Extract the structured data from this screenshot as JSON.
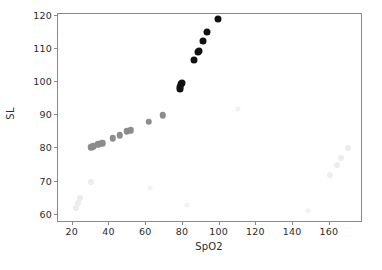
{
  "figure": {
    "background_color": "#ffffff",
    "axes_color": "#8a8a8a",
    "text_color": "#2b2b2b"
  },
  "chart_data": {
    "type": "scatter",
    "title": "",
    "xlabel": "SpO2",
    "ylabel": "SL",
    "xlim": [
      12,
      178
    ],
    "ylim": [
      57.5,
      120.5
    ],
    "xticks": [
      20,
      40,
      60,
      80,
      100,
      120,
      140,
      160
    ],
    "yticks": [
      60,
      70,
      80,
      90,
      100,
      110,
      120
    ],
    "xtick_labels": [
      "20",
      "40",
      "60",
      "80",
      "100",
      "120",
      "140",
      "160"
    ],
    "ytick_labels": [
      "60",
      "70",
      "80",
      "90",
      "100",
      "110",
      "120"
    ],
    "grid": false,
    "legend": null,
    "marker": "circle",
    "note": "Point shade encodes a third variable: near-white for the faintest outlier groups, mid-gray for the main low-SpO2 arm, and black for the steep high-SpO2 arm.",
    "series": [
      {
        "name": "very-faint-lower-left",
        "color": "#ececec",
        "marker_size": 6,
        "points": [
          {
            "x": 22,
            "y": 62.0
          },
          {
            "x": 23,
            "y": 63.5
          },
          {
            "x": 24,
            "y": 65.0
          },
          {
            "x": 30,
            "y": 70.0
          }
        ]
      },
      {
        "name": "very-faint-lower-right",
        "color": "#ededed",
        "marker_size": 6,
        "points": [
          {
            "x": 160,
            "y": 72.0
          },
          {
            "x": 164,
            "y": 75.0
          },
          {
            "x": 166,
            "y": 77.0
          },
          {
            "x": 170,
            "y": 80.0
          }
        ]
      },
      {
        "name": "faint-scatter",
        "color": "#f2f2f2",
        "marker_size": 5,
        "points": [
          {
            "x": 62,
            "y": 68.0
          },
          {
            "x": 82,
            "y": 63.0
          },
          {
            "x": 110,
            "y": 92.0
          },
          {
            "x": 148,
            "y": 61.0
          }
        ]
      },
      {
        "name": "mid-gray-arm",
        "color": "#8c8c8c",
        "marker_size": 6.5,
        "points": [
          {
            "x": 30.0,
            "y": 80.3
          },
          {
            "x": 31.2,
            "y": 80.6
          },
          {
            "x": 33.8,
            "y": 81.2
          },
          {
            "x": 35.2,
            "y": 81.4
          },
          {
            "x": 36.2,
            "y": 81.6
          },
          {
            "x": 41.8,
            "y": 83.0
          },
          {
            "x": 45.6,
            "y": 84.0
          },
          {
            "x": 49.4,
            "y": 85.1
          },
          {
            "x": 50.6,
            "y": 85.3
          },
          {
            "x": 51.6,
            "y": 85.4
          },
          {
            "x": 61.4,
            "y": 88.0
          },
          {
            "x": 69.0,
            "y": 90.0
          }
        ]
      },
      {
        "name": "dark-arm",
        "color": "#111111",
        "marker_size": 7,
        "points": [
          {
            "x": 78.2,
            "y": 98.0
          },
          {
            "x": 78.6,
            "y": 98.4
          },
          {
            "x": 79.2,
            "y": 99.4
          },
          {
            "x": 79.6,
            "y": 99.7
          },
          {
            "x": 86.2,
            "y": 106.5
          },
          {
            "x": 88.0,
            "y": 109.0
          },
          {
            "x": 88.8,
            "y": 109.3
          },
          {
            "x": 91.0,
            "y": 112.5
          },
          {
            "x": 93.2,
            "y": 115.2
          },
          {
            "x": 99.0,
            "y": 118.9
          }
        ]
      }
    ]
  }
}
